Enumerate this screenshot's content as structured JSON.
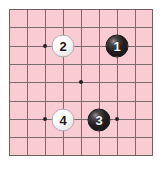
{
  "diagram": {
    "type": "go-board-diagram",
    "board": {
      "columns": 9,
      "rows": 9,
      "background_color": "#f9ccd4",
      "grid_color": "#7a6b6e",
      "edge_color": "#6d5f62",
      "cell_size_px": 18,
      "origin_x_px": 9,
      "origin_y_px": 9
    },
    "star_points": [
      {
        "col": 3,
        "row": 3
      },
      {
        "col": 7,
        "row": 3
      },
      {
        "col": 5,
        "row": 5
      },
      {
        "col": 3,
        "row": 7
      },
      {
        "col": 7,
        "row": 7
      }
    ],
    "stones": [
      {
        "number": "1",
        "color": "black",
        "col": 7,
        "row": 3
      },
      {
        "number": "2",
        "color": "white",
        "col": 4,
        "row": 3
      },
      {
        "number": "3",
        "color": "black",
        "col": 6,
        "row": 7
      },
      {
        "number": "4",
        "color": "white",
        "col": 4,
        "row": 7
      }
    ],
    "colors": {
      "black_stone": "#231f20",
      "white_stone": "#fbfbfb",
      "black_label": "#ffffff",
      "white_label": "#1b1718",
      "star_point": "#2a2022"
    }
  }
}
